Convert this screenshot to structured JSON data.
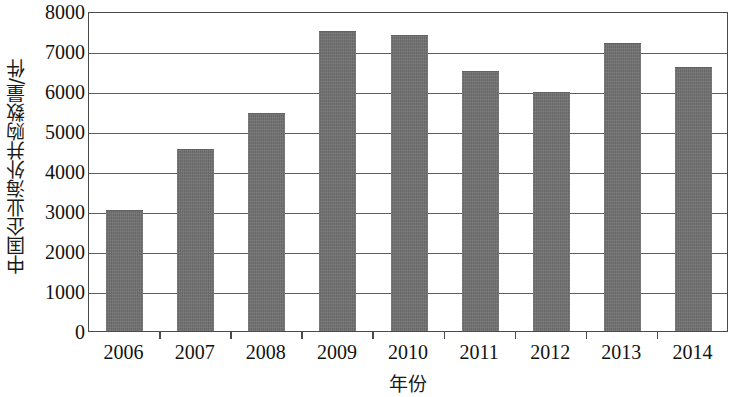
{
  "chart_data": {
    "type": "bar",
    "title": "",
    "subtitle": "",
    "xlabel": "年份",
    "ylabel": "中国企业海外并购数量/件",
    "categories": [
      "2006",
      "2007",
      "2008",
      "2009",
      "2010",
      "2011",
      "2012",
      "2013",
      "2014"
    ],
    "values": [
      3030,
      4550,
      5450,
      7500,
      7390,
      6490,
      5980,
      7210,
      6590
    ],
    "series": [
      {
        "name": "中国企业海外并购数量",
        "values": [
          3030,
          4550,
          5450,
          7500,
          7390,
          6490,
          5980,
          7210,
          6590
        ]
      }
    ],
    "ylim": [
      0,
      8000
    ],
    "y_ticks": [
      0,
      1000,
      2000,
      3000,
      4000,
      5000,
      6000,
      7000,
      8000
    ],
    "y_tick_labels": [
      "0",
      "1000",
      "2000",
      "3000",
      "4000",
      "5000",
      "6000",
      "7000",
      "8000"
    ],
    "grid": true,
    "grid_axis": "y",
    "legend": false,
    "legend_position": "none",
    "bar_color": "#707070",
    "frame_color": "#4a4a4a",
    "background_color": "#ffffff",
    "annotations": []
  }
}
